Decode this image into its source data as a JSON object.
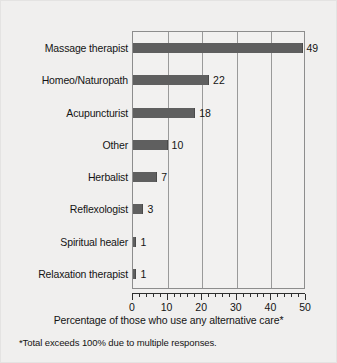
{
  "chart_data": {
    "type": "bar",
    "orientation": "horizontal",
    "title": "",
    "xlabel": "Percentage of those who use any alternative care*",
    "ylabel": "",
    "xlim": [
      0,
      50
    ],
    "xticks": [
      0,
      10,
      20,
      30,
      40,
      50
    ],
    "xtick_labels": [
      "0",
      "10",
      "20",
      "30",
      "40",
      "50"
    ],
    "minor_tick_interval": 2,
    "grid": "vertical",
    "gridlines": [
      10,
      20,
      30,
      40
    ],
    "legend": "none",
    "bar_color": "#5f5f5f",
    "plot_background": "#f2f1f0",
    "figure_background": "#f0efee",
    "categories": [
      "Massage therapist",
      "Homeo/Naturopath",
      "Acupuncturist",
      "Other",
      "Herbalist",
      "Reflexologist",
      "Spiritual healer",
      "Relaxation therapist"
    ],
    "values": [
      49,
      22,
      18,
      10,
      7,
      3,
      1,
      1
    ],
    "value_labels": [
      "49",
      "22",
      "18",
      "10",
      "7",
      "3",
      "1",
      "1"
    ],
    "footnote": "*Total exceeds 100% due to multiple responses."
  }
}
